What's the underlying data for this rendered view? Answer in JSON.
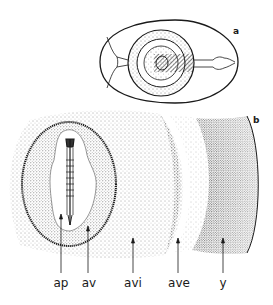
{
  "figure": {
    "panels": [
      {
        "id": "a",
        "label": "a",
        "description": "Egg in top view showing blastoderm areas and chalazae"
      },
      {
        "id": "b",
        "label": "b",
        "description": "Enlarged blastoderm with embryo and extra-embryonic areas"
      }
    ],
    "labels": [
      {
        "key": "ap",
        "text": "ap"
      },
      {
        "key": "av",
        "text": "av"
      },
      {
        "key": "avi",
        "text": "avi"
      },
      {
        "key": "ave",
        "text": "ave"
      },
      {
        "key": "y",
        "text": "y"
      }
    ],
    "colors": {
      "ink": "#1a1a1a",
      "background": "#ffffff"
    }
  }
}
